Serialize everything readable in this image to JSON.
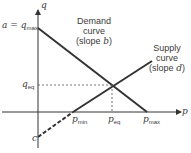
{
  "axes": {
    "x_label": "p",
    "y_label": "q"
  },
  "y_intercept_label": {
    "prefix": "a = ",
    "var": "q",
    "sub": "max"
  },
  "q_eq_label": {
    "var": "q",
    "sub": "eq"
  },
  "c_label": "c",
  "x_ticks": [
    {
      "var": "p",
      "sub": "min"
    },
    {
      "var": "p",
      "sub": "eq"
    },
    {
      "var": "p",
      "sub": "max"
    }
  ],
  "demand": {
    "line1": "Demand",
    "line2": "curve",
    "line3_prefix": "(slope ",
    "slope_var": "b",
    "line3_suffix": ")"
  },
  "supply": {
    "line1": "Supply",
    "line2": "curve",
    "line3_prefix": "(slope ",
    "slope_var": "d",
    "line3_suffix": ")"
  },
  "colors": {
    "line": "#333333",
    "text": "#3a3a3a"
  }
}
